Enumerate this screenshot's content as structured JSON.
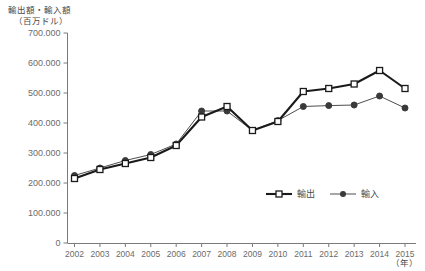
{
  "chart_data": {
    "type": "line",
    "title": "",
    "ylabel_line1": "輸出額・輸入額",
    "ylabel_line2": "（百万ドル）",
    "xlabel": "（年）",
    "categories": [
      2002,
      2003,
      2004,
      2005,
      2006,
      2007,
      2008,
      2009,
      2010,
      2011,
      2012,
      2013,
      2014,
      2015
    ],
    "x_tick_labels": [
      "2002",
      "2003",
      "2004",
      "2005",
      "2006",
      "2007",
      "2008",
      "2009",
      "2010",
      "2011",
      "2012",
      "2013",
      "2014",
      "2015"
    ],
    "y_tick_labels": [
      "0",
      "100.000",
      "200.000",
      "300.000",
      "400.000",
      "500.000",
      "600.000",
      "700.000"
    ],
    "y_tick_values": [
      0,
      100000,
      200000,
      300000,
      400000,
      500000,
      600000,
      700000
    ],
    "ylim": [
      0,
      700000
    ],
    "grid": false,
    "legend_position": "inside-lower-right",
    "series": [
      {
        "name": "輸出",
        "marker": "open-square",
        "color": "#1a1a1a",
        "line_width": 2.1,
        "values": [
          215000,
          245000,
          265000,
          285000,
          325000,
          420000,
          455000,
          375000,
          405000,
          505000,
          515000,
          530000,
          575000,
          515000
        ]
      },
      {
        "name": "輸入",
        "marker": "filled-circle",
        "color": "#3a3a3a",
        "line_width": 0.9,
        "values": [
          225000,
          250000,
          275000,
          295000,
          330000,
          440000,
          440000,
          375000,
          408000,
          455000,
          458000,
          460000,
          490000,
          450000
        ]
      }
    ]
  },
  "legend": {
    "items": [
      {
        "label": "輸出",
        "marker": "open-square"
      },
      {
        "label": "輸入",
        "marker": "filled-circle"
      }
    ]
  }
}
